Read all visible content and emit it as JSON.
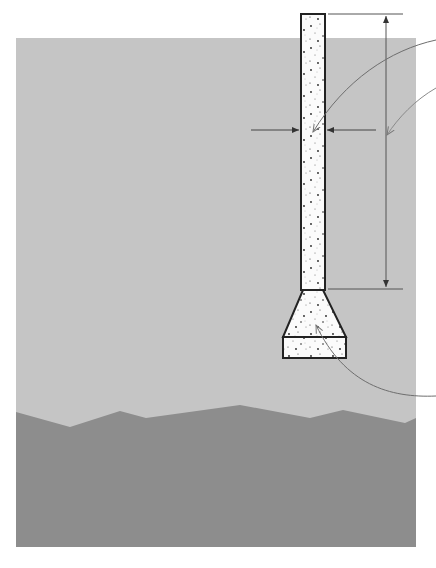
{
  "diagram": {
    "type": "pier-footing-cross-section",
    "labels": [],
    "colors": {
      "background": "#ffffff",
      "soil_upper": "#c5c5c5",
      "soil_lower": "#8d8d8d",
      "concrete_fill": "#fbfbfb",
      "outline": "#222222",
      "dimension_line": "#555555",
      "leader_line": "#6e6e6e"
    },
    "elements": {
      "soil_region": {
        "x": 16,
        "y": 38,
        "width": 400,
        "height": 509
      },
      "ground_profile": [
        [
          16,
          412
        ],
        [
          70,
          427
        ],
        [
          120,
          411
        ],
        [
          146,
          418
        ],
        [
          240,
          405
        ],
        [
          310,
          418
        ],
        [
          343,
          410
        ],
        [
          405,
          423
        ],
        [
          416,
          418
        ]
      ],
      "pier_column": {
        "x": 301,
        "y": 14,
        "width": 24,
        "height": 276
      },
      "footing_flare": {
        "top_y": 290,
        "bottom_y": 337,
        "top_left": 303,
        "top_right": 323,
        "bottom_left": 283,
        "bottom_right": 346
      },
      "footing_base": {
        "x": 283,
        "y": 337,
        "width": 63,
        "height": 21
      },
      "height_dimension": {
        "x": 386,
        "top_y": 14,
        "bottom_y": 289,
        "ext_x1": 328,
        "ext_x2": 403
      },
      "width_dimension": {
        "y": 130,
        "left_arrow": [
          251,
          299
        ],
        "right_arrow": [
          376,
          327
        ]
      },
      "leaders": [
        {
          "name": "pier-leader",
          "from": [
            436,
            40
          ],
          "to": [
            313,
            132
          ]
        },
        {
          "name": "height-leader",
          "from": [
            436,
            88
          ],
          "to": [
            387,
            135
          ]
        },
        {
          "name": "footing-leader",
          "from": [
            436,
            396
          ],
          "to": [
            316,
            325
          ]
        }
      ]
    }
  }
}
